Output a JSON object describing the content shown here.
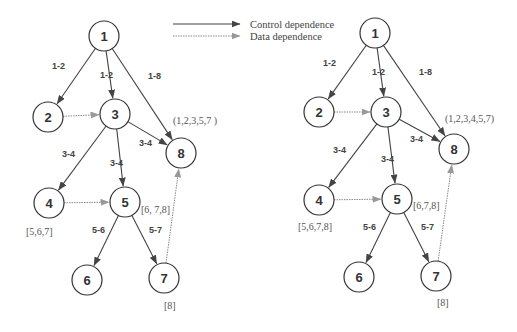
{
  "legend": {
    "control": "Control dependence",
    "data": "Data dependence"
  },
  "colors": {
    "control": "#444444",
    "data": "#888888",
    "node_stroke": "#333333"
  },
  "graphs": [
    {
      "name": "left",
      "nodes": [
        {
          "id": "1",
          "x": 104,
          "y": 36
        },
        {
          "id": "2",
          "x": 48,
          "y": 117
        },
        {
          "id": "3",
          "x": 115,
          "y": 114
        },
        {
          "id": "8",
          "x": 181,
          "y": 153
        },
        {
          "id": "4",
          "x": 49,
          "y": 203
        },
        {
          "id": "5",
          "x": 125,
          "y": 202
        },
        {
          "id": "6",
          "x": 87,
          "y": 280
        },
        {
          "id": "7",
          "x": 164,
          "y": 278
        }
      ],
      "edges": [
        {
          "from": "1",
          "to": "2",
          "type": "control",
          "label": "1-2",
          "lx": 52,
          "ly": 69
        },
        {
          "from": "1",
          "to": "3",
          "type": "control",
          "label": "1-2",
          "lx": 100,
          "ly": 78
        },
        {
          "from": "1",
          "to": "8",
          "type": "control",
          "label": "1-8",
          "lx": 148,
          "ly": 79
        },
        {
          "from": "2",
          "to": "3",
          "type": "data",
          "label": ""
        },
        {
          "from": "3",
          "to": "8",
          "type": "control",
          "label": "3-4",
          "lx": 139,
          "ly": 146
        },
        {
          "from": "3",
          "to": "4",
          "type": "control",
          "label": "3-4",
          "lx": 62,
          "ly": 157
        },
        {
          "from": "3",
          "to": "5",
          "type": "control",
          "label": "3-4",
          "lx": 110,
          "ly": 166
        },
        {
          "from": "4",
          "to": "5",
          "type": "data",
          "label": ""
        },
        {
          "from": "5",
          "to": "6",
          "type": "control",
          "label": "5-6",
          "lx": 92,
          "ly": 233
        },
        {
          "from": "5",
          "to": "7",
          "type": "control",
          "label": "5-7",
          "lx": 149,
          "ly": 233
        },
        {
          "from": "7",
          "to": "8",
          "type": "data",
          "label": ""
        }
      ],
      "sets": [
        {
          "text": "(1,2,3,5,7 )",
          "x": 173,
          "y": 124
        },
        {
          "text": "[6, 7,8]",
          "x": 141,
          "y": 213
        },
        {
          "text": "[5,6,7]",
          "x": 26,
          "y": 235
        },
        {
          "text": "[8]",
          "x": 164,
          "y": 309
        }
      ]
    },
    {
      "name": "right",
      "nodes": [
        {
          "id": "1",
          "x": 375,
          "y": 33
        },
        {
          "id": "2",
          "x": 319,
          "y": 112
        },
        {
          "id": "3",
          "x": 386,
          "y": 112
        },
        {
          "id": "8",
          "x": 454,
          "y": 149
        },
        {
          "id": "4",
          "x": 319,
          "y": 200
        },
        {
          "id": "5",
          "x": 397,
          "y": 199
        },
        {
          "id": "6",
          "x": 359,
          "y": 277
        },
        {
          "id": "7",
          "x": 436,
          "y": 276
        }
      ],
      "edges": [
        {
          "from": "1",
          "to": "2",
          "type": "control",
          "label": "1-2",
          "lx": 323,
          "ly": 66
        },
        {
          "from": "1",
          "to": "3",
          "type": "control",
          "label": "1-2",
          "lx": 372,
          "ly": 75
        },
        {
          "from": "1",
          "to": "8",
          "type": "control",
          "label": "1-8",
          "lx": 419,
          "ly": 75
        },
        {
          "from": "2",
          "to": "3",
          "type": "data",
          "label": ""
        },
        {
          "from": "3",
          "to": "8",
          "type": "control",
          "label": "3-4",
          "lx": 410,
          "ly": 142
        },
        {
          "from": "3",
          "to": "4",
          "type": "control",
          "label": "3-4",
          "lx": 333,
          "ly": 153
        },
        {
          "from": "3",
          "to": "5",
          "type": "control",
          "label": "3-4",
          "lx": 381,
          "ly": 162
        },
        {
          "from": "4",
          "to": "5",
          "type": "data",
          "label": ""
        },
        {
          "from": "5",
          "to": "6",
          "type": "control",
          "label": "5-6",
          "lx": 363,
          "ly": 230
        },
        {
          "from": "5",
          "to": "7",
          "type": "control",
          "label": "5-7",
          "lx": 421,
          "ly": 230
        },
        {
          "from": "7",
          "to": "8",
          "type": "data",
          "label": ""
        }
      ],
      "sets": [
        {
          "text": "(1,2,3,4,5,7)",
          "x": 445,
          "y": 122
        },
        {
          "text": "[6,7,8]",
          "x": 413,
          "y": 209
        },
        {
          "text": "[5,6,7,8]",
          "x": 298,
          "y": 230
        },
        {
          "text": "[8]",
          "x": 437,
          "y": 306
        }
      ]
    }
  ]
}
